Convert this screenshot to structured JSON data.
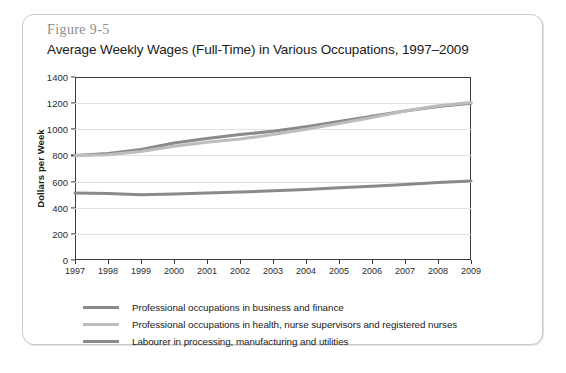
{
  "figure": {
    "label": "Figure 9-5",
    "title": "Average Weekly Wages (Full-Time) in Various Occupations, 1997–2009"
  },
  "colors": {
    "series_dark": "#8a8a8a",
    "series_light": "#bdbdbd",
    "axis": "#3a3a3a",
    "grid": "#e2e2e2",
    "card_border": "#c9c9c9",
    "label_gray": "#8d8d8d"
  },
  "chart_data": {
    "type": "line",
    "title": "Average Weekly Wages (Full-Time) in Various Occupations, 1997–2009",
    "xlabel": "",
    "ylabel": "Dollars per Week",
    "categories": [
      "1997",
      "1998",
      "1999",
      "2000",
      "2001",
      "2002",
      "2003",
      "2004",
      "2005",
      "2006",
      "2007",
      "2008",
      "2009"
    ],
    "x": [
      1997,
      1998,
      1999,
      2000,
      2001,
      2002,
      2003,
      2004,
      2005,
      2006,
      2007,
      2008,
      2009
    ],
    "ylim": [
      0,
      1400
    ],
    "yticks": [
      0,
      200,
      400,
      600,
      800,
      1000,
      1200,
      1400
    ],
    "ytick_labels": [
      "0",
      "200",
      "400",
      "600",
      "800",
      "1000",
      "1200",
      "1400"
    ],
    "grid": true,
    "legend_position": "below",
    "series": [
      {
        "name": "Professional occupations in business and finance",
        "color": "#8a8a8a",
        "values": [
          800,
          815,
          845,
          895,
          930,
          960,
          985,
          1020,
          1060,
          1100,
          1140,
          1175,
          1200
        ]
      },
      {
        "name": "Professional occupations in health, nurse supervisors and registered nurses",
        "color": "#bdbdbd",
        "values": [
          800,
          805,
          830,
          870,
          900,
          925,
          960,
          1000,
          1045,
          1090,
          1140,
          1180,
          1205
        ]
      },
      {
        "name": "Labourer in processing, manufacturing and utilities",
        "color": "#8a8a8a",
        "values": [
          512,
          508,
          500,
          505,
          512,
          520,
          530,
          540,
          552,
          565,
          578,
          592,
          605
        ]
      }
    ]
  },
  "legend": [
    {
      "label": "Professional occupations in business and finance",
      "color": "#8a8a8a"
    },
    {
      "label": "Professional occupations in health, nurse supervisors and registered nurses",
      "color": "#bdbdbd"
    },
    {
      "label": "Labourer in processing, manufacturing and utilities",
      "color": "#8a8a8a"
    }
  ]
}
